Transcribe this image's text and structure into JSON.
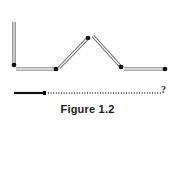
{
  "figure": {
    "caption": "Figure 1.2",
    "question_mark": "?",
    "matchstick_color": "#ffffff",
    "matchstick_outline": "#555555",
    "head_color": "#111111",
    "matchsticks": [
      {
        "id": "vertical-left",
        "x1": 14,
        "y1": 22,
        "x2": 14,
        "y2": 66
      },
      {
        "id": "horizontal-1",
        "x1": 16,
        "y1": 69,
        "x2": 57,
        "y2": 69
      },
      {
        "id": "diagonal-up",
        "x1": 59,
        "y1": 68,
        "x2": 89,
        "y2": 37
      },
      {
        "id": "diagonal-down",
        "x1": 93,
        "y1": 36,
        "x2": 121,
        "y2": 67
      },
      {
        "id": "horizontal-2",
        "x1": 124,
        "y1": 69,
        "x2": 166,
        "y2": 69
      }
    ],
    "heads": [
      {
        "x": 14,
        "y": 65
      },
      {
        "x": 56,
        "y": 69
      },
      {
        "x": 88,
        "y": 38
      },
      {
        "x": 121,
        "y": 67
      },
      {
        "x": 165,
        "y": 69
      }
    ],
    "bottom_line": {
      "solid_x1": 14,
      "solid_x2": 44,
      "dotted_x1": 48,
      "dotted_x2": 161,
      "y": 93
    }
  }
}
